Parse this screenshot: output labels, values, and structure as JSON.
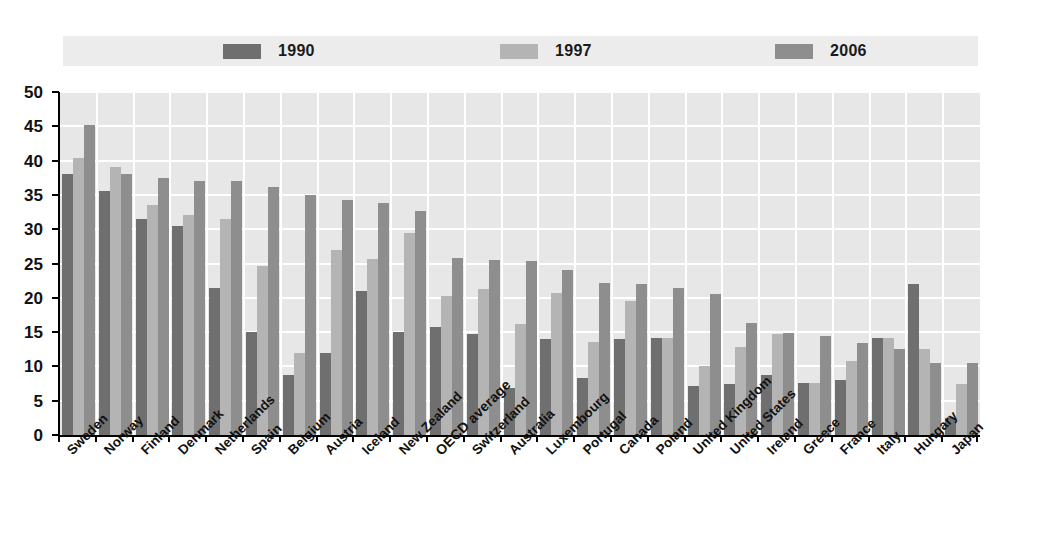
{
  "legend": {
    "items": [
      {
        "label": "1990",
        "color": "#6f6f6f"
      },
      {
        "label": "1997",
        "color": "#b4b4b4"
      },
      {
        "label": "2006",
        "color": "#8e8e8e"
      }
    ]
  },
  "axis": {
    "y_ticks": [
      "0",
      "5",
      "10",
      "15",
      "20",
      "25",
      "30",
      "35",
      "40",
      "45",
      "50"
    ]
  },
  "chart_data": {
    "type": "bar",
    "title": "",
    "subtitle": "",
    "xlabel": "",
    "ylabel": "",
    "ylim": [
      0,
      50
    ],
    "ytick_step": 5,
    "grid": true,
    "legend_position": "top",
    "categories": [
      "Sweden",
      "Norway",
      "Finland",
      "Denmark",
      "Netherlands",
      "Spain",
      "Belgium",
      "Austria",
      "Iceland",
      "New Zealand",
      "OECD average",
      "Switzerland",
      "Australia",
      "Luxembourg",
      "Portugal",
      "Canada",
      "Poland",
      "United Kingdom",
      "United States",
      "Ireland",
      "Greece",
      "France",
      "Italy",
      "Hungary",
      "Japan"
    ],
    "emphasized_category": "OECD average",
    "series": [
      {
        "name": "1990",
        "color": "#6f6f6f",
        "values": [
          38.0,
          35.5,
          31.5,
          30.5,
          21.5,
          15.0,
          8.7,
          12.0,
          21.0,
          15.0,
          15.7,
          14.7,
          6.8,
          14.0,
          8.3,
          14.0,
          14.2,
          7.1,
          7.5,
          8.7,
          7.6,
          8.0,
          14.1,
          22.0,
          2.5
        ]
      },
      {
        "name": "1997",
        "color": "#b4b4b4",
        "values": [
          40.4,
          39.0,
          33.5,
          32.0,
          31.5,
          24.7,
          12.0,
          27.0,
          25.7,
          29.5,
          20.2,
          21.3,
          16.2,
          20.7,
          13.5,
          19.5,
          14.2,
          10.0,
          12.8,
          14.7,
          7.6,
          10.8,
          14.1,
          12.5,
          7.5
        ]
      },
      {
        "name": "2006",
        "color": "#8e8e8e",
        "values": [
          45.2,
          38.0,
          37.5,
          37.0,
          37.0,
          36.2,
          35.0,
          34.2,
          33.8,
          32.7,
          25.8,
          25.5,
          25.3,
          24.1,
          22.2,
          22.0,
          21.4,
          20.6,
          16.3,
          14.8,
          14.4,
          13.4,
          12.6,
          10.5,
          10.5
        ]
      }
    ]
  }
}
